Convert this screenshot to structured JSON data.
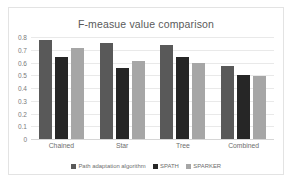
{
  "chart_data": {
    "type": "bar",
    "title": "F-measue value comparison",
    "xlabel": "",
    "ylabel": "",
    "categories": [
      "Chained",
      "Star",
      "Tree",
      "Combined"
    ],
    "series": [
      {
        "name": "Path adaptation algorithm",
        "color": "#595959",
        "values": [
          0.775,
          0.755,
          0.735,
          0.575
        ]
      },
      {
        "name": "SPATH",
        "color": "#262626",
        "values": [
          0.64,
          0.555,
          0.64,
          0.5
        ]
      },
      {
        "name": "SPARKER",
        "color": "#a6a6a6",
        "values": [
          0.715,
          0.615,
          0.6,
          0.497
        ]
      }
    ],
    "ylim": [
      0,
      0.8
    ],
    "yticks": [
      "0",
      "0.1",
      "0.2",
      "0.3",
      "0.4",
      "0.5",
      "0.6",
      "0.7",
      "0.8"
    ],
    "grid": true,
    "legend_position": "bottom"
  }
}
